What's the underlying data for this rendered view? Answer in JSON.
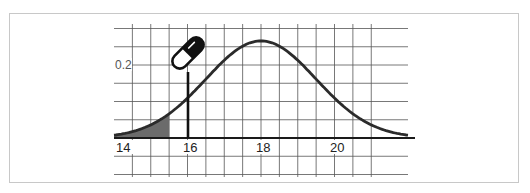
{
  "chart_data": {
    "type": "line",
    "title": "",
    "xlabel": "",
    "ylabel": "",
    "distribution": "normal",
    "mean": 18,
    "std_dev": 1.5,
    "x_ticks": [
      "14",
      "16",
      "18",
      "20"
    ],
    "y_ticks": [
      "0.2"
    ],
    "xlim": [
      14,
      22
    ],
    "ylim": [
      -0.1,
      0.3
    ],
    "grid": true,
    "grid_x_step": 0.5,
    "grid_y_step": 0.05,
    "series": [
      {
        "name": "density",
        "x": [
          14,
          14.5,
          15,
          15.5,
          16,
          16.5,
          17,
          17.5,
          18,
          18.5,
          19,
          19.5,
          20,
          20.5,
          21,
          21.5,
          22
        ],
        "values": [
          0.011,
          0.02,
          0.036,
          0.066,
          0.109,
          0.161,
          0.213,
          0.252,
          0.266,
          0.252,
          0.213,
          0.161,
          0.109,
          0.066,
          0.036,
          0.02,
          0.011
        ]
      }
    ],
    "shaded_region": {
      "from": 14,
      "to": 15.5,
      "color": "#6b6b6b"
    },
    "marker_line": {
      "x": 16,
      "label_icon": "pill-icon"
    },
    "legend": null
  },
  "labels": {
    "x14": "14",
    "x16": "16",
    "x18": "18",
    "x20": "20",
    "y02": "0.2"
  },
  "colors": {
    "curve": "#2b2b2b",
    "grid": "#555555",
    "shade": "#6b6b6b",
    "frame": "#c8c8c8"
  }
}
